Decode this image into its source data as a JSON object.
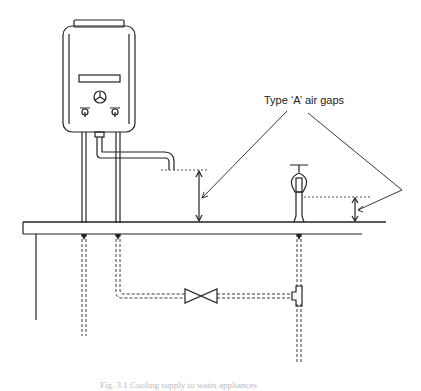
{
  "figure": {
    "annotation_label": "Type ‘A’ air gaps",
    "caption": "Fig. 3.1   Cooling supply to water appliances",
    "components": [
      {
        "name": "instantaneous water heater",
        "controls": [
          "display panel",
          "control knob",
          "left tap",
          "right tap"
        ]
      },
      {
        "name": "swivel spout outlet"
      },
      {
        "name": "pillar tap"
      },
      {
        "name": "worktop / counter"
      },
      {
        "name": "stop valve"
      },
      {
        "name": "tee connection"
      },
      {
        "name": "concealed supply pipework (dashed)"
      }
    ],
    "colors": {
      "line": "#222222",
      "background": "#ffffff",
      "caption": "#bbbbbb"
    }
  }
}
